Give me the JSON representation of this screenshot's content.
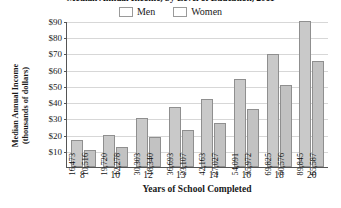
{
  "chart_data": {
    "type": "bar",
    "title": "Median Annual Income, by Level of Education, 2011",
    "xlabel": "Years of School Completed",
    "ylabel": "Median Annual Income (thousands of dollars)",
    "ylabel_line1": "Median Annual Income",
    "ylabel_line2": "(thousands of dollars)",
    "categories": [
      "8",
      "10",
      "12",
      "13",
      "14",
      "16",
      "18",
      "20"
    ],
    "ylim": [
      0,
      90000
    ],
    "ytick_values": [
      90000,
      80000,
      70000,
      60000,
      50000,
      40000,
      30000,
      20000,
      10000
    ],
    "ytick_labels": [
      "$90",
      "$80",
      "$70",
      "$60",
      "$50",
      "$40",
      "$30",
      "$20",
      "$10"
    ],
    "grid": true,
    "legend_position": "top-center",
    "series": [
      {
        "name": "Men",
        "color": "#c9c9c9",
        "values": [
          16473,
          19720,
          30303,
          36693,
          42163,
          54091,
          69825,
          89845
        ],
        "labels": [
          "16,473",
          "19,720",
          "30,303",
          "36,693",
          "42,163",
          "54,091",
          "69,825",
          "89,845"
        ]
      },
      {
        "name": "Women",
        "color": "#c2c2c2",
        "values": [
          10516,
          12278,
          18340,
          23107,
          27027,
          35972,
          50576,
          65587
        ],
        "labels": [
          "10,516",
          "12,278",
          "18,340",
          "23,107",
          "27,027",
          "35,972",
          "50,576",
          "65,587"
        ]
      }
    ]
  }
}
